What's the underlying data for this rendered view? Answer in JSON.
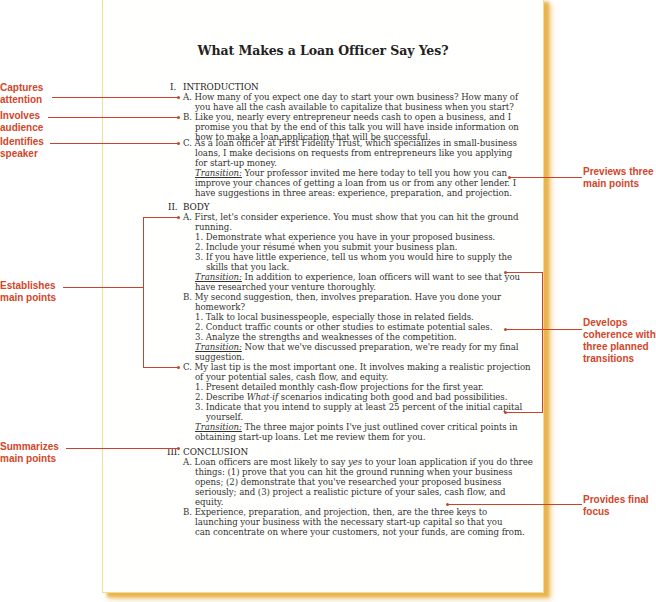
{
  "document": {
    "title": "What Makes a Loan Officer Say Yes?",
    "sections": [
      {
        "numeral": "I.",
        "heading": "INTRODUCTION",
        "lines": [
          "A. How many of you expect one day to start your own business? How many of",
          "you have all the cash available to capitalize that business when you start?",
          "B. Like you, nearly every entrepreneur needs cash to open a business, and I",
          "promise you that by the end of this talk you will have inside information on",
          "how to make a loan application that will be successful.",
          "C. As a loan officer at First Fidelity Trust, which specializes in small-business",
          "loans, I make decisions on requests from entrepreneurs like you applying",
          "for start-up money.",
          " Your professor invited me here today to tell you how you can",
          "improve your chances of getting a loan from us or from any other lender. I",
          "have suggestions in three areas: experience, preparation, and projection."
        ]
      },
      {
        "numeral": "II.",
        "heading": "BODY",
        "lines": [
          "A. First, let's consider experience. You must show that you can hit the ground",
          "running.",
          "1. Demonstrate what experience you have in your proposed business.",
          "2. Include your résumé when you submit your business plan.",
          "3. If you have little experience, tell us whom you would hire to supply the",
          "skills that you lack.",
          " In addition to experience, loan officers will want to see that you",
          "have researched your venture thoroughly.",
          "B. My second suggestion, then, involves preparation. Have you done your",
          "homework?",
          "1. Talk to local businesspeople, especially those in related fields.",
          "2. Conduct traffic counts or other studies to estimate potential sales.",
          "3. Analyze the strengths and weaknesses of the competition.",
          " Now that we've discussed preparation, we're ready for my final",
          "suggestion.",
          "C. My last tip is the most important one. It involves making a realistic projection",
          "of your potential sales, cash flow, and equity.",
          "1. Present detailed monthly cash-flow projections for the first year.",
          "2. Describe ",
          "What-if",
          " scenarios indicating both good and bad possibilities.",
          "3. Indicate that you intend to supply at least 25 percent of the initial capital",
          "yourself.",
          " The three major points I've just outlined cover critical points in",
          "obtaining start-up loans. Let me review them for you."
        ]
      },
      {
        "numeral": "III.",
        "heading": "CONCLUSION",
        "lines": [
          "A. Loan officers are most likely to say ",
          "yes",
          " to your loan application if you do three",
          "things: (1) prove that you can hit the ground running when your business",
          "opens; (2) demonstrate that you've researched your proposed business",
          "seriously; and (3) project a realistic picture of your sales, cash flow, and",
          "equity.",
          "B. Experience, preparation, and projection, then, are the three keys to",
          "launching your business with the necessary start-up capital so that you",
          "can concentrate on where your customers, not your funds, are coming from."
        ]
      }
    ],
    "transition_label": "Transition:"
  },
  "annotations": {
    "left": [
      {
        "line1": "Captures",
        "line2": "attention"
      },
      {
        "line1": "Involves",
        "line2": "audience"
      },
      {
        "line1": "Identifies",
        "line2": "speaker"
      },
      {
        "line1": "Establishes",
        "line2": "main points"
      },
      {
        "line1": "Summarizes",
        "line2": "main points"
      }
    ],
    "right": [
      {
        "line1": "Previews three",
        "line2": "main points"
      },
      {
        "line1": "Develops",
        "line2": "coherence with",
        "line3": "three planned",
        "line4": "transitions"
      },
      {
        "line1": "Provides final",
        "line2": "focus"
      }
    ]
  },
  "colors": {
    "annotation": "#d2462a",
    "connector": "#c9432c",
    "page_shadow": "#e9b54a"
  }
}
